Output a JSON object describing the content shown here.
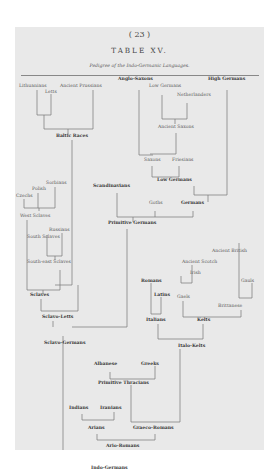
{
  "page": {
    "number": "( 23 )",
    "title": "TABLE XV.",
    "subtitle": "Pedigree of the Indo-Germanic Languages."
  },
  "tree": {
    "lithuanians": "Lithuanians",
    "ancient_prussians": "Ancient Prussians",
    "letts": "Letts",
    "baltic_races": "Baltic Races",
    "anglo_saxons": "Anglo-Saxons",
    "high_germans": "High Germans",
    "low_germans_top": "Low Germans",
    "netherlanders": "Netherlanders",
    "ancient_saxons": "Ancient Saxons",
    "saxons": "Saxons",
    "friesians": "Friesians",
    "low_germans": "Low Germans",
    "scandinavians": "Scandinavians",
    "goths": "Goths",
    "germans": "Germans",
    "primitive_germans": "Primitive Germans",
    "sorbians": "Sorbians",
    "polish": "Polish",
    "czechs": "Czechs",
    "west_sclaves": "West Sclaves",
    "russians": "Russians",
    "south_sclaves": "South Sclaves",
    "south_east_sclaves": "South-east Sclaves",
    "sclaves": "Sclaves",
    "sclavo_letts": "Sclavo-Letts",
    "sclavo_germans": "Sclavo-Germans",
    "ancient_british": "Ancient British",
    "ancient_scotch": "Ancient Scotch",
    "irish": "Irish",
    "gauls_right": "Gauls",
    "romans": "Romans",
    "latins": "Latins",
    "gaels": "Gaels",
    "brittanese": "Brittanese",
    "italians": "Italians",
    "kelts": "Kelts",
    "italo_kelts": "Italo-Kelts",
    "albanese": "Albanese",
    "greeks": "Greeks",
    "primitive_thracians": "Primitive Thracians",
    "indians": "Indians",
    "iranians": "Iranians",
    "arians": "Arians",
    "graeco_romans": "Graeco-Romans",
    "ario_romans": "Ario-Romans",
    "indo_germans": "Indo-Germans"
  }
}
